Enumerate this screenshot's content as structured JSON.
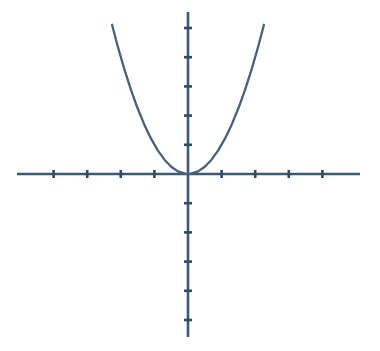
{
  "figure": {
    "width": 380,
    "height": 351,
    "background_color": "#ffffff",
    "title": "",
    "caption": ""
  },
  "style": {
    "axis_color": "#3d5a75",
    "curve_color": "#48607a",
    "tick_color": "#2f4a66",
    "axis_stroke_width": 2.6,
    "curve_stroke_width": 2.3,
    "tick_stroke_width": 2.6,
    "tick_half_length": 4
  },
  "geometry": {
    "origin_x": 188,
    "origin_y": 174,
    "x_unit_px": 33.6,
    "y_unit_px": 29.2,
    "x_axis_start_px": 17,
    "x_axis_end_px": 360,
    "y_axis_start_px": 12,
    "y_axis_end_px": 337
  },
  "chart_data": {
    "type": "line",
    "title": "",
    "subtitle": "",
    "xlabel": "",
    "ylabel": "",
    "equation": "y = x^2",
    "grid": false,
    "legend": null,
    "axes": {
      "x_axis": {
        "label": "",
        "range": [
          -5.1,
          5.1
        ],
        "tick_values": [
          -4,
          -3,
          -2,
          -1,
          1,
          2,
          3,
          4
        ],
        "tick_labels": [],
        "tick_interval": 1,
        "zero_tick_shown": false,
        "arrowheads": false
      },
      "y_axis": {
        "label": "",
        "range": [
          -5.6,
          5.6
        ],
        "tick_values": [
          -5,
          -4,
          -3,
          -2,
          -1,
          1,
          2,
          3,
          4,
          5
        ],
        "tick_labels": [],
        "tick_interval": 1,
        "zero_tick_shown": false,
        "arrowheads": false
      }
    },
    "series": [
      {
        "name": "y = x^2",
        "color": "#48607a",
        "vertex": [
          0,
          0
        ],
        "opens": "up",
        "x": [
          -2.26,
          -2.1,
          -1.9,
          -1.7,
          -1.5,
          -1.3,
          -1.1,
          -0.9,
          -0.7,
          -0.5,
          -0.3,
          -0.1,
          0,
          0.1,
          0.3,
          0.5,
          0.7,
          0.9,
          1.1,
          1.3,
          1.5,
          1.7,
          1.9,
          2.1,
          2.26
        ],
        "values": [
          5.11,
          4.41,
          3.61,
          2.89,
          2.25,
          1.69,
          1.21,
          0.81,
          0.49,
          0.25,
          0.09,
          0.01,
          0,
          0.01,
          0.09,
          0.25,
          0.49,
          0.81,
          1.21,
          1.69,
          2.25,
          2.89,
          3.61,
          4.41,
          5.11
        ]
      }
    ],
    "annotations": []
  }
}
